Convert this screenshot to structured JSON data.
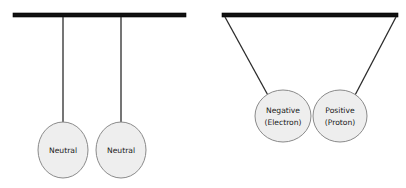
{
  "figure": {
    "title": "",
    "background_color": "#ffffff",
    "ball_fill_color": "#eeeeee",
    "ball_stroke_color": "#8a8a8a",
    "bar_color": "#111111",
    "string_color": "#2b2b2b",
    "label_color": "#1a1a1a"
  },
  "panels": [
    {
      "id": "left-panel",
      "name": "neutral-pair-panel",
      "support_bar": {
        "x1": 13,
        "x2": 186,
        "y": 13,
        "thickness": 4
      },
      "pendulums": [
        {
          "id": "left-neutral",
          "label_line1": "Neutral",
          "label_line2": "",
          "string": {
            "x1": 63,
            "y1": 17,
            "x2": 63,
            "y2": 128
          },
          "ball": {
            "cx": 63,
            "cy": 150,
            "rx": 25,
            "ry": 28
          }
        },
        {
          "id": "right-neutral",
          "label_line1": "Neutral",
          "label_line2": "",
          "string": {
            "x1": 121,
            "y1": 17,
            "x2": 121,
            "y2": 128
          },
          "ball": {
            "cx": 121,
            "cy": 150,
            "rx": 25,
            "ry": 28
          }
        }
      ]
    },
    {
      "id": "right-panel",
      "name": "charged-pair-panel",
      "support_bar": {
        "x1": 222,
        "x2": 398,
        "y": 13,
        "thickness": 4
      },
      "pendulums": [
        {
          "id": "electron-ball",
          "label_line1": "Negative",
          "label_line2": "(Electron)",
          "string": {
            "x1": 225,
            "y1": 17,
            "x2": 270,
            "y2": 98
          },
          "ball": {
            "cx": 283,
            "cy": 116,
            "rx": 28,
            "ry": 26
          }
        },
        {
          "id": "proton-ball",
          "label_line1": "Positive",
          "label_line2": "(Proton)",
          "string": {
            "x1": 396,
            "y1": 17,
            "x2": 353,
            "y2": 98
          },
          "ball": {
            "cx": 340,
            "cy": 116,
            "rx": 27,
            "ry": 26
          }
        }
      ]
    }
  ],
  "labels": {
    "neutral_left": "Neutral",
    "neutral_right": "Neutral",
    "negative_main": "Negative",
    "negative_sub": "(Electron)",
    "positive_main": "Positive",
    "positive_sub": "(Proton)"
  }
}
